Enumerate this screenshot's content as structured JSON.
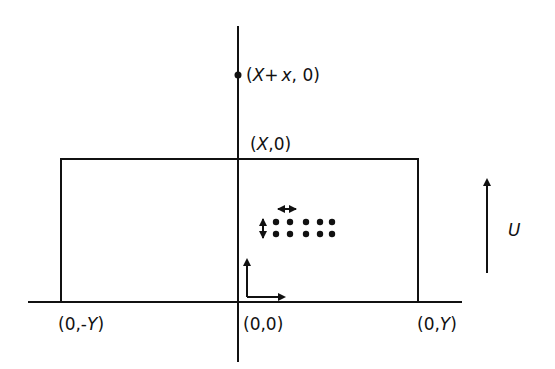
{
  "diagram": {
    "labels": {
      "top_point": "(X+x, 0)",
      "top_point_parts": {
        "open": "(",
        "X": "X",
        "plus": "+",
        "x": "x",
        "rest": ", 0)"
      },
      "rect_top": "(X,0)",
      "rect_top_parts": {
        "open": "(",
        "X": "X",
        "rest": ",0)"
      },
      "origin": "(0,0)",
      "left_corner": "(0,-Y)",
      "left_corner_parts": {
        "open": "(0,-",
        "Y": "Y",
        "close": ")"
      },
      "right_corner": "(0,Y)",
      "right_corner_parts": {
        "open": "(0,",
        "Y": "Y",
        "close": ")"
      },
      "flow_label": "U"
    },
    "colors": {
      "stroke": "#111111",
      "background": "#ffffff"
    },
    "dot_array": {
      "rows": 2,
      "cols": 5
    }
  }
}
